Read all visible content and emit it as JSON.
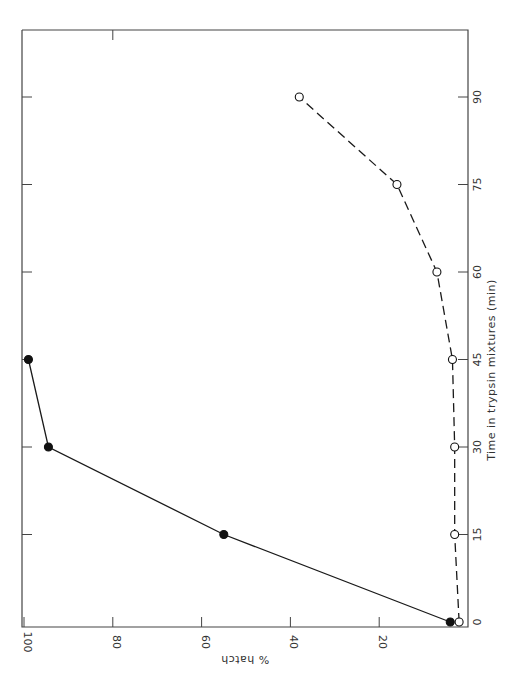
{
  "chart_data": {
    "type": "line",
    "orientation": "rotated-90-clockwise",
    "title": "",
    "xlabel": "Time in trypsin mixtures (min)",
    "ylabel": "% hatch",
    "x": [
      0,
      15,
      30,
      45,
      60,
      75,
      90
    ],
    "x_ticks": [
      "0",
      "15",
      "30",
      "45",
      "60",
      "75",
      "90"
    ],
    "y_ticks": [
      "20",
      "40",
      "60",
      "80",
      "100"
    ],
    "xlim": [
      0,
      105
    ],
    "ylim": [
      0,
      100
    ],
    "grid": false,
    "legend": null,
    "series": [
      {
        "name": "filled circles (solid line)",
        "marker": "filled-circle",
        "line": "solid",
        "x": [
          0,
          15,
          30,
          45
        ],
        "values": [
          4,
          55,
          94.5,
          99
        ]
      },
      {
        "name": "open circles (dashed line)",
        "marker": "open-circle",
        "line": "dashed",
        "x": [
          0,
          15,
          30,
          45,
          60,
          75,
          90
        ],
        "values": [
          2,
          3,
          3,
          3.5,
          7,
          16,
          38
        ]
      }
    ]
  },
  "axes": {
    "time_label": "Time in trypsin mixtures (min)",
    "hatch_label": "% hatch"
  }
}
